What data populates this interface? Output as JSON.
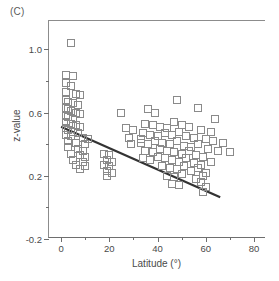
{
  "figure": {
    "panel_label": "(C)",
    "accent_color": "#333333",
    "marker_color": "#8a8a8a",
    "axis_color": "#6e6e6e"
  },
  "chart_data": {
    "type": "scatter",
    "title": "(C)",
    "xlabel": "Latitude (°)",
    "ylabel": "z-value",
    "xlim": [
      -5,
      85
    ],
    "ylim": [
      -0.2,
      1.18
    ],
    "grid": false,
    "legend": null,
    "x_ticks": [
      0,
      20,
      40,
      60,
      80
    ],
    "x_tick_labels": [
      "0",
      "20",
      "40",
      "60",
      "80"
    ],
    "x_minor_ticks": [
      10,
      30,
      50,
      70
    ],
    "y_ticks": [
      -0.2,
      0.2,
      0.6,
      1.0
    ],
    "y_tick_labels": [
      "-0.2",
      "0.2",
      "0.6",
      "1.0"
    ],
    "y_minor_ticks": [
      0.0,
      0.4,
      0.8
    ],
    "marker_style": "open-square",
    "series": [
      {
        "name": "observations",
        "points": [
          [
            4,
            1.04
          ],
          [
            2,
            0.84
          ],
          [
            5,
            0.83
          ],
          [
            2,
            0.79
          ],
          [
            4,
            0.77
          ],
          [
            2,
            0.73
          ],
          [
            6,
            0.72
          ],
          [
            8,
            0.71
          ],
          [
            2,
            0.68
          ],
          [
            3,
            0.67
          ],
          [
            5,
            0.66
          ],
          [
            7,
            0.65
          ],
          [
            2,
            0.63
          ],
          [
            3,
            0.62
          ],
          [
            4,
            0.61
          ],
          [
            6,
            0.6
          ],
          [
            8,
            0.59
          ],
          [
            2,
            0.58
          ],
          [
            3,
            0.57
          ],
          [
            5,
            0.56
          ],
          [
            25,
            0.6
          ],
          [
            39,
            0.6
          ],
          [
            2,
            0.54
          ],
          [
            4,
            0.53
          ],
          [
            6,
            0.52
          ],
          [
            8,
            0.51
          ],
          [
            2,
            0.5
          ],
          [
            3,
            0.49
          ],
          [
            5,
            0.48
          ],
          [
            7,
            0.47
          ],
          [
            27,
            0.5
          ],
          [
            30,
            0.49
          ],
          [
            2,
            0.46
          ],
          [
            4,
            0.45
          ],
          [
            9,
            0.44
          ],
          [
            11,
            0.43
          ],
          [
            28,
            0.44
          ],
          [
            33,
            0.43
          ],
          [
            3,
            0.42
          ],
          [
            6,
            0.41
          ],
          [
            10,
            0.4
          ],
          [
            29,
            0.4
          ],
          [
            3,
            0.38
          ],
          [
            7,
            0.37
          ],
          [
            9,
            0.36
          ],
          [
            4,
            0.34
          ],
          [
            8,
            0.33
          ],
          [
            10,
            0.32
          ],
          [
            18,
            0.34
          ],
          [
            20,
            0.33
          ],
          [
            5,
            0.3
          ],
          [
            9,
            0.29
          ],
          [
            19,
            0.3
          ],
          [
            21,
            0.29
          ],
          [
            6,
            0.27
          ],
          [
            10,
            0.26
          ],
          [
            18,
            0.27
          ],
          [
            20,
            0.26
          ],
          [
            8,
            0.24
          ],
          [
            19,
            0.23
          ],
          [
            21,
            0.22
          ],
          [
            19,
            0.2
          ],
          [
            36,
            0.62
          ],
          [
            48,
            0.68
          ],
          [
            57,
            0.63
          ],
          [
            64,
            0.56
          ],
          [
            35,
            0.53
          ],
          [
            38,
            0.52
          ],
          [
            41,
            0.51
          ],
          [
            44,
            0.5
          ],
          [
            47,
            0.54
          ],
          [
            50,
            0.52
          ],
          [
            53,
            0.51
          ],
          [
            58,
            0.49
          ],
          [
            62,
            0.48
          ],
          [
            34,
            0.47
          ],
          [
            37,
            0.46
          ],
          [
            40,
            0.45
          ],
          [
            43,
            0.47
          ],
          [
            46,
            0.46
          ],
          [
            49,
            0.48
          ],
          [
            52,
            0.45
          ],
          [
            55,
            0.44
          ],
          [
            60,
            0.43
          ],
          [
            63,
            0.42
          ],
          [
            67,
            0.41
          ],
          [
            33,
            0.41
          ],
          [
            36,
            0.4
          ],
          [
            39,
            0.42
          ],
          [
            42,
            0.41
          ],
          [
            45,
            0.4
          ],
          [
            48,
            0.42
          ],
          [
            51,
            0.39
          ],
          [
            54,
            0.38
          ],
          [
            57,
            0.4
          ],
          [
            61,
            0.37
          ],
          [
            65,
            0.36
          ],
          [
            35,
            0.36
          ],
          [
            38,
            0.35
          ],
          [
            41,
            0.37
          ],
          [
            44,
            0.36
          ],
          [
            47,
            0.35
          ],
          [
            50,
            0.34
          ],
          [
            53,
            0.36
          ],
          [
            56,
            0.33
          ],
          [
            59,
            0.32
          ],
          [
            70,
            0.35
          ],
          [
            34,
            0.31
          ],
          [
            37,
            0.3
          ],
          [
            40,
            0.32
          ],
          [
            43,
            0.31
          ],
          [
            46,
            0.3
          ],
          [
            49,
            0.29
          ],
          [
            52,
            0.31
          ],
          [
            55,
            0.28
          ],
          [
            58,
            0.27
          ],
          [
            62,
            0.29
          ],
          [
            42,
            0.26
          ],
          [
            45,
            0.25
          ],
          [
            48,
            0.24
          ],
          [
            51,
            0.26
          ],
          [
            54,
            0.23
          ],
          [
            57,
            0.25
          ],
          [
            60,
            0.22
          ],
          [
            44,
            0.2
          ],
          [
            47,
            0.19
          ],
          [
            50,
            0.21
          ],
          [
            56,
            0.18
          ],
          [
            59,
            0.2
          ],
          [
            46,
            0.15
          ],
          [
            49,
            0.14
          ],
          [
            58,
            0.16
          ],
          [
            60,
            0.13
          ],
          [
            59,
            0.1
          ]
        ]
      }
    ],
    "fit_line": {
      "name": "linear regression",
      "x_start": 0.0,
      "y_start": 0.51,
      "x_end": 66.0,
      "y_end": 0.065,
      "slope": -0.00674,
      "intercept": 0.51
    }
  }
}
